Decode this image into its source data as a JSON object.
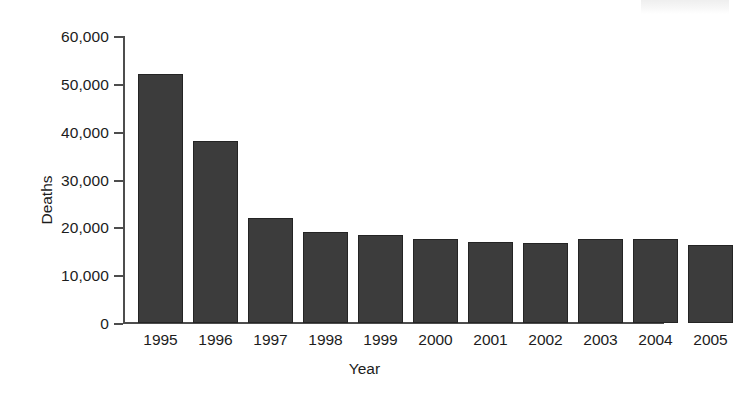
{
  "chart_data": {
    "type": "bar",
    "title": "",
    "xlabel": "Year",
    "ylabel": "Deaths",
    "categories": [
      "1995",
      "1996",
      "1997",
      "1998",
      "1999",
      "2000",
      "2001",
      "2002",
      "2003",
      "2004",
      "2005"
    ],
    "values": [
      52000,
      38000,
      22000,
      19000,
      18500,
      17500,
      17000,
      16700,
      17500,
      17600,
      16300
    ],
    "ylim": [
      0,
      60000
    ],
    "ytick_values": [
      0,
      10000,
      20000,
      30000,
      40000,
      50000,
      60000
    ],
    "ytick_labels": [
      "0",
      "10,000",
      "20,000",
      "30,000",
      "40,000",
      "50,000",
      "60,000"
    ],
    "grid": false,
    "legend": false,
    "bar_color": "#3c3c3c",
    "axis_color": "#4d4d4d",
    "background": "#ffffff"
  }
}
